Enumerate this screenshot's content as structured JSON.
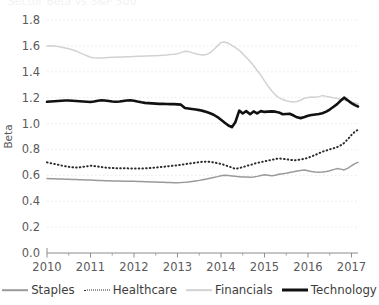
{
  "figure": {
    "clipped_title": "Sector Beta vs S&P 500",
    "ylabel": "Beta"
  },
  "legend": [
    {
      "label": "Staples",
      "color": "#9a9a9a",
      "style": "solid",
      "width": 1.6
    },
    {
      "label": "Healthcare",
      "color": "#2b2b2b",
      "style": "dotted",
      "width": 1.9
    },
    {
      "label": "Financials",
      "color": "#d2d2d2",
      "style": "solid",
      "width": 1.7
    },
    {
      "label": "Technology",
      "color": "#111111",
      "style": "solid",
      "width": 3.0
    }
  ],
  "chart_data": {
    "type": "line",
    "title": "Sector Beta vs S&P 500",
    "xlabel": "",
    "ylabel": "Beta",
    "xlim": [
      2010.0,
      2017.15
    ],
    "ylim": [
      0.0,
      1.8
    ],
    "yticks": [
      "0.0",
      "0.2",
      "0.4",
      "0.6",
      "0.8",
      "1.0",
      "1.2",
      "1.4",
      "1.6",
      "1.8"
    ],
    "xticks": [
      "2010",
      "2011",
      "2012",
      "2013",
      "2014",
      "2015",
      "2016",
      "2017"
    ],
    "grid": "horizontal-dotted",
    "legend_position": "bottom",
    "x": [
      2010.0,
      2010.08,
      2010.17,
      2010.25,
      2010.33,
      2010.42,
      2010.5,
      2010.58,
      2010.67,
      2010.75,
      2010.83,
      2010.92,
      2011.0,
      2011.08,
      2011.17,
      2011.25,
      2011.33,
      2011.42,
      2011.5,
      2011.58,
      2011.67,
      2011.75,
      2011.83,
      2011.92,
      2012.0,
      2012.08,
      2012.17,
      2012.25,
      2012.33,
      2012.42,
      2012.5,
      2012.58,
      2012.67,
      2012.75,
      2012.83,
      2012.92,
      2013.0,
      2013.08,
      2013.17,
      2013.25,
      2013.33,
      2013.42,
      2013.5,
      2013.58,
      2013.67,
      2013.75,
      2013.83,
      2013.92,
      2014.0,
      2014.08,
      2014.17,
      2014.25,
      2014.33,
      2014.42,
      2014.5,
      2014.58,
      2014.67,
      2014.75,
      2014.83,
      2014.92,
      2015.0,
      2015.08,
      2015.17,
      2015.25,
      2015.33,
      2015.42,
      2015.5,
      2015.58,
      2015.67,
      2015.75,
      2015.83,
      2015.92,
      2016.0,
      2016.08,
      2016.17,
      2016.25,
      2016.33,
      2016.42,
      2016.5,
      2016.58,
      2016.67,
      2016.75,
      2016.83,
      2016.92,
      2017.0,
      2017.08,
      2017.15
    ],
    "series": [
      {
        "name": "Staples",
        "color": "#9a9a9a",
        "style": "solid",
        "values": [
          0.575,
          0.574,
          0.573,
          0.572,
          0.571,
          0.57,
          0.569,
          0.568,
          0.567,
          0.566,
          0.565,
          0.564,
          0.563,
          0.562,
          0.561,
          0.56,
          0.559,
          0.558,
          0.557,
          0.556,
          0.556,
          0.555,
          0.555,
          0.554,
          0.554,
          0.553,
          0.552,
          0.551,
          0.55,
          0.549,
          0.548,
          0.547,
          0.546,
          0.545,
          0.544,
          0.543,
          0.543,
          0.544,
          0.546,
          0.549,
          0.553,
          0.557,
          0.561,
          0.566,
          0.572,
          0.578,
          0.584,
          0.59,
          0.597,
          0.6,
          0.598,
          0.595,
          0.592,
          0.59,
          0.588,
          0.587,
          0.586,
          0.588,
          0.592,
          0.598,
          0.604,
          0.6,
          0.596,
          0.6,
          0.608,
          0.612,
          0.616,
          0.622,
          0.628,
          0.634,
          0.638,
          0.642,
          0.636,
          0.63,
          0.626,
          0.624,
          0.626,
          0.63,
          0.636,
          0.644,
          0.652,
          0.648,
          0.642,
          0.656,
          0.674,
          0.69,
          0.7
        ]
      },
      {
        "name": "Healthcare",
        "color": "#2b2b2b",
        "style": "dotted",
        "values": [
          0.7,
          0.694,
          0.688,
          0.682,
          0.676,
          0.67,
          0.666,
          0.662,
          0.66,
          0.662,
          0.666,
          0.67,
          0.675,
          0.672,
          0.668,
          0.664,
          0.66,
          0.658,
          0.656,
          0.655,
          0.655,
          0.654,
          0.654,
          0.653,
          0.652,
          0.652,
          0.653,
          0.654,
          0.656,
          0.658,
          0.66,
          0.663,
          0.666,
          0.669,
          0.672,
          0.675,
          0.678,
          0.682,
          0.686,
          0.69,
          0.694,
          0.698,
          0.702,
          0.705,
          0.706,
          0.704,
          0.7,
          0.694,
          0.688,
          0.68,
          0.67,
          0.66,
          0.65,
          0.656,
          0.664,
          0.672,
          0.68,
          0.688,
          0.696,
          0.702,
          0.708,
          0.714,
          0.72,
          0.726,
          0.73,
          0.728,
          0.724,
          0.72,
          0.716,
          0.718,
          0.722,
          0.728,
          0.736,
          0.746,
          0.758,
          0.77,
          0.782,
          0.792,
          0.8,
          0.808,
          0.818,
          0.832,
          0.85,
          0.88,
          0.912,
          0.938,
          0.952
        ]
      },
      {
        "name": "Financials",
        "color": "#d2d2d2",
        "style": "solid",
        "values": [
          1.6,
          1.602,
          1.6,
          1.596,
          1.59,
          1.584,
          1.578,
          1.57,
          1.56,
          1.548,
          1.536,
          1.524,
          1.512,
          1.508,
          1.506,
          1.506,
          1.508,
          1.51,
          1.512,
          1.513,
          1.514,
          1.515,
          1.516,
          1.517,
          1.518,
          1.519,
          1.52,
          1.521,
          1.522,
          1.523,
          1.524,
          1.526,
          1.528,
          1.53,
          1.533,
          1.536,
          1.54,
          1.548,
          1.558,
          1.556,
          1.548,
          1.54,
          1.534,
          1.53,
          1.534,
          1.548,
          1.57,
          1.6,
          1.626,
          1.63,
          1.62,
          1.604,
          1.586,
          1.565,
          1.54,
          1.512,
          1.48,
          1.446,
          1.41,
          1.372,
          1.33,
          1.29,
          1.252,
          1.222,
          1.2,
          1.186,
          1.176,
          1.17,
          1.166,
          1.17,
          1.18,
          1.196,
          1.202,
          1.206,
          1.204,
          1.208,
          1.216,
          1.21,
          1.205,
          1.2,
          1.196,
          1.188,
          1.18,
          1.172,
          1.164,
          1.158,
          1.152
        ]
      },
      {
        "name": "Technology",
        "color": "#111111",
        "style": "solid",
        "values": [
          1.168,
          1.17,
          1.172,
          1.174,
          1.176,
          1.178,
          1.178,
          1.176,
          1.174,
          1.172,
          1.17,
          1.168,
          1.166,
          1.17,
          1.176,
          1.18,
          1.178,
          1.174,
          1.17,
          1.168,
          1.17,
          1.174,
          1.178,
          1.18,
          1.176,
          1.17,
          1.164,
          1.16,
          1.158,
          1.156,
          1.154,
          1.152,
          1.152,
          1.151,
          1.15,
          1.15,
          1.148,
          1.146,
          1.12,
          1.116,
          1.112,
          1.108,
          1.104,
          1.098,
          1.09,
          1.08,
          1.068,
          1.05,
          1.03,
          1.008,
          0.985,
          0.972,
          1.01,
          1.1,
          1.078,
          1.096,
          1.072,
          1.094,
          1.078,
          1.096,
          1.09,
          1.092,
          1.094,
          1.092,
          1.086,
          1.072,
          1.074,
          1.076,
          1.062,
          1.048,
          1.042,
          1.05,
          1.06,
          1.066,
          1.07,
          1.074,
          1.08,
          1.092,
          1.108,
          1.128,
          1.15,
          1.176,
          1.2,
          1.178,
          1.158,
          1.142,
          1.132
        ]
      }
    ]
  }
}
